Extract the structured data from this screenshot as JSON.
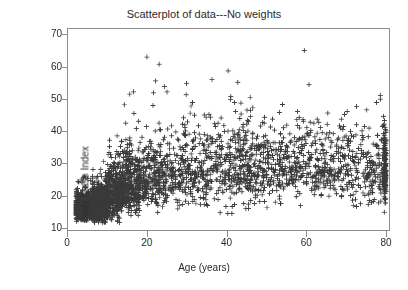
{
  "chart_data": {
    "type": "scatter",
    "title": "Scatterplot of data---No weights",
    "xlabel": "Age (years)",
    "ylabel": "Body Mass Index",
    "xlim": [
      0,
      81
    ],
    "ylim": [
      9,
      72
    ],
    "xticks": [
      0,
      20,
      40,
      60,
      80
    ],
    "yticks": [
      10,
      20,
      30,
      40,
      50,
      60,
      70
    ],
    "xtick_labels": [
      "0",
      "20",
      "40",
      "60",
      "80"
    ],
    "ytick_labels": [
      "10",
      "20",
      "30",
      "40",
      "50",
      "60",
      "70"
    ],
    "grid": false,
    "legend": null,
    "marker": "plus",
    "marker_color": "#3a3a3a",
    "marker_size_px": 5,
    "n_points": 4200,
    "series": [
      {
        "name": "Body Mass Index vs Age",
        "description": "Dense cross-marker scatter of BMI against age; tight low-BMI cluster in childhood widening into a broad adult band centered near BMI 27-29 with a top-coded vertical stack at age 80.",
        "age_bands": [
          {
            "age_min": 2,
            "age_max": 6,
            "bmi_median": 15.8,
            "bmi_p05": 13.5,
            "bmi_p95": 19.0,
            "bmi_max": 26.0,
            "density": 0.3
          },
          {
            "age_min": 6,
            "age_max": 10,
            "bmi_median": 16.8,
            "bmi_p05": 13.8,
            "bmi_p95": 23.0,
            "bmi_max": 31.0,
            "density": 0.16
          },
          {
            "age_min": 10,
            "age_max": 14,
            "bmi_median": 19.8,
            "bmi_p05": 15.0,
            "bmi_p95": 28.5,
            "bmi_max": 41.0,
            "density": 0.1
          },
          {
            "age_min": 14,
            "age_max": 18,
            "bmi_median": 22.5,
            "bmi_p05": 17.0,
            "bmi_p95": 33.0,
            "bmi_max": 55.0,
            "density": 0.08
          },
          {
            "age_min": 18,
            "age_max": 25,
            "bmi_median": 25.0,
            "bmi_p05": 18.5,
            "bmi_p95": 36.0,
            "bmi_max": 64.5,
            "density": 0.07
          },
          {
            "age_min": 25,
            "age_max": 35,
            "bmi_median": 27.2,
            "bmi_p05": 19.5,
            "bmi_p95": 39.0,
            "bmi_max": 61.0,
            "density": 0.07
          },
          {
            "age_min": 35,
            "age_max": 45,
            "bmi_median": 28.3,
            "bmi_p05": 20.0,
            "bmi_p95": 40.5,
            "bmi_max": 62.0,
            "density": 0.07
          },
          {
            "age_min": 45,
            "age_max": 55,
            "bmi_median": 28.9,
            "bmi_p05": 20.5,
            "bmi_p95": 41.0,
            "bmi_max": 64.5,
            "density": 0.07
          },
          {
            "age_min": 55,
            "age_max": 65,
            "bmi_median": 29.0,
            "bmi_p05": 20.5,
            "bmi_p95": 40.0,
            "bmi_max": 67.5,
            "density": 0.06
          },
          {
            "age_min": 65,
            "age_max": 75,
            "bmi_median": 28.2,
            "bmi_p05": 19.5,
            "bmi_p95": 38.5,
            "bmi_max": 63.5,
            "density": 0.05
          },
          {
            "age_min": 75,
            "age_max": 80,
            "bmi_median": 27.0,
            "bmi_p05": 18.5,
            "bmi_p95": 36.5,
            "bmi_max": 52.0,
            "density": 0.03
          },
          {
            "age_min": 80,
            "age_max": 80,
            "bmi_median": 27.0,
            "bmi_p05": 18.0,
            "bmi_p95": 37.0,
            "bmi_max": 44.0,
            "density": 0.04
          }
        ]
      }
    ]
  }
}
